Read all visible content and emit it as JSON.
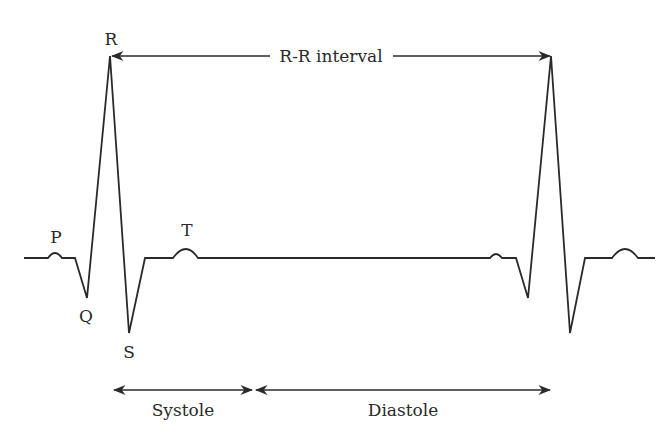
{
  "diagram": {
    "wave_labels": {
      "p": "P",
      "q": "Q",
      "r": "R",
      "s": "S",
      "t": "T"
    },
    "intervals": {
      "rr": "R-R interval",
      "systole": "Systole",
      "diastole": "Diastole"
    },
    "colors": {
      "line": "#2a2a2a",
      "background": "#ffffff"
    }
  }
}
